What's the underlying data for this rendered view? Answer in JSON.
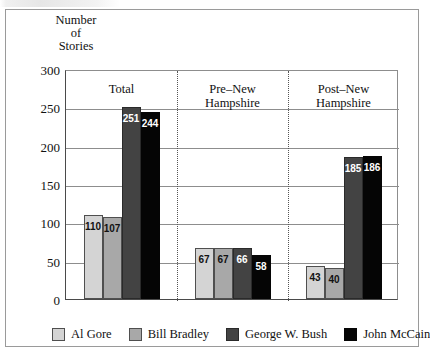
{
  "chart_data": {
    "type": "bar",
    "title": "",
    "xlabel": "",
    "ylabel": "Number of Stories",
    "ylabel_lines": [
      "Number",
      "of",
      "Stories"
    ],
    "ylim": [
      0,
      300
    ],
    "ytick_values": [
      0,
      50,
      100,
      150,
      200,
      250,
      300
    ],
    "ytick_labels": [
      "0",
      "50",
      "100",
      "150",
      "200",
      "250",
      "300"
    ],
    "minor_tick_step": 10,
    "grid": "horizontal",
    "legend_position": "bottom",
    "categories": [
      "Total",
      "Pre–New Hampshire",
      "Post–New Hampshire"
    ],
    "category_label_lines": [
      [
        "Total"
      ],
      [
        "Pre–New",
        "Hampshire"
      ],
      [
        "Post–New",
        "Hampshire"
      ]
    ],
    "series": [
      {
        "name": "Al Gore",
        "color": "#d4d4d4",
        "values": [
          110,
          67,
          43
        ]
      },
      {
        "name": "Bill Bradley",
        "color": "#a8a8a8",
        "values": [
          107,
          67,
          40
        ]
      },
      {
        "name": "George W. Bush",
        "color": "#434343",
        "values": [
          251,
          66,
          185
        ]
      },
      {
        "name": "John McCain",
        "color": "#050505",
        "values": [
          244,
          58,
          186
        ]
      }
    ],
    "data_labels": [
      [
        "110",
        "107",
        "251",
        "244"
      ],
      [
        "67",
        "67",
        "66",
        "58"
      ],
      [
        "43",
        "40",
        "185",
        "186"
      ]
    ],
    "label_text_colors": [
      [
        "dark",
        "dark",
        "light",
        "light"
      ],
      [
        "dark",
        "dark",
        "light",
        "light"
      ],
      [
        "dark",
        "dark",
        "light",
        "light"
      ]
    ]
  },
  "legend": {
    "items": [
      {
        "label": "Al Gore"
      },
      {
        "label": "Bill Bradley"
      },
      {
        "label": "George W. Bush"
      },
      {
        "label": "John McCain"
      }
    ]
  }
}
